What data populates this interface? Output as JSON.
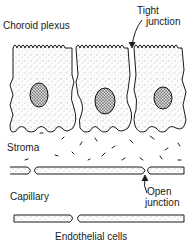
{
  "diagram": {
    "labels": {
      "choroid_plexus": "Choroid plexus",
      "tight_junction_line1": "Tight",
      "tight_junction_line2": "junction",
      "stroma": "Stroma",
      "capillary": "Capillary",
      "open_junction_line1": "Open",
      "open_junction_line2": "junction",
      "endothelial_cells": "Endothelial cells"
    },
    "components": {
      "epithelial_cells": 3,
      "nuclei": 3,
      "capillary_walls": 2,
      "junction_types": [
        "tight",
        "open"
      ]
    },
    "colors": {
      "ink": "#1a1a1a",
      "stipple": "#444444",
      "background": "#ffffff"
    }
  }
}
